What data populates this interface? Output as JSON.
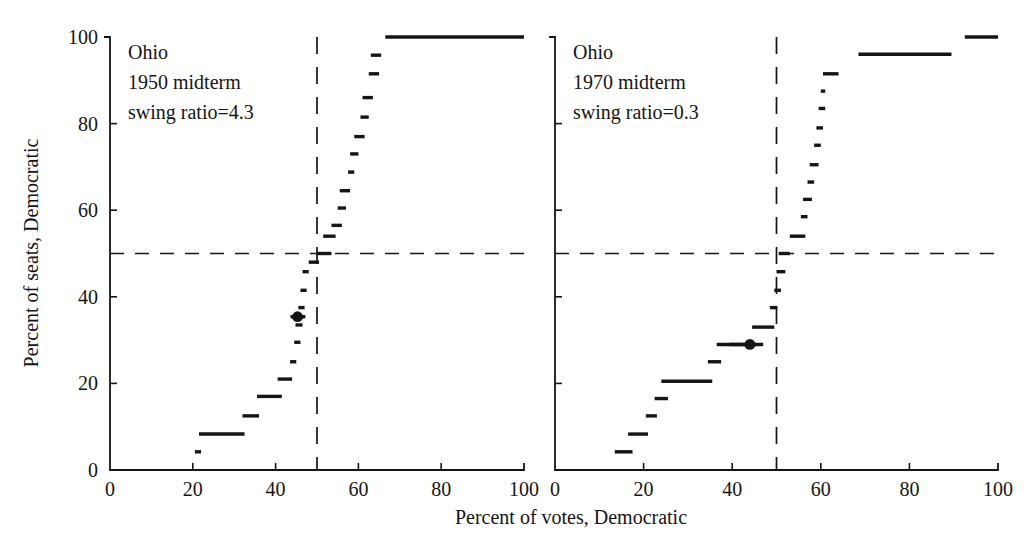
{
  "figure": {
    "title": "",
    "axis_titles": {
      "x": "Percent of votes, Democratic",
      "y": "Percent of seats, Democratic"
    },
    "colors": {
      "ink": "#151515",
      "background": "#ffffff"
    },
    "reference_lines": {
      "horizontal_value": 50,
      "vertical_value": 50,
      "style": "dashed"
    }
  },
  "chart_data": [
    {
      "type": "line",
      "panel_index": 0,
      "title": "Ohio",
      "annotations": [
        "Ohio",
        "1950 midterm",
        "swing ratio=4.3"
      ],
      "swing_ratio": 4.3,
      "state": "Ohio",
      "year": 1950,
      "election_type": "midterm",
      "xlabel": "Percent of votes, Democratic",
      "ylabel": "Percent of seats, Democratic",
      "xlim": [
        0,
        100
      ],
      "ylim": [
        0,
        100
      ],
      "xticks": [
        0,
        20,
        40,
        60,
        80,
        100
      ],
      "yticks": [
        0,
        20,
        40,
        60,
        80,
        100
      ],
      "grid": false,
      "legend": "none",
      "series": [
        {
          "name": "seats-votes curve",
          "style": "step",
          "steps": [
            {
              "x_start": 20.5,
              "x_end": 22.0,
              "y": 4.2
            },
            {
              "x_start": 21.5,
              "x_end": 32.5,
              "y": 8.3
            },
            {
              "x_start": 32.0,
              "x_end": 36.0,
              "y": 12.5
            },
            {
              "x_start": 35.5,
              "x_end": 41.5,
              "y": 17.0
            },
            {
              "x_start": 40.5,
              "x_end": 44.0,
              "y": 21.0
            },
            {
              "x_start": 43.5,
              "x_end": 45.0,
              "y": 25.0
            },
            {
              "x_start": 44.5,
              "x_end": 46.0,
              "y": 29.5
            },
            {
              "x_start": 44.8,
              "x_end": 46.5,
              "y": 33.5
            },
            {
              "x_start": 44.2,
              "x_end": 46.8,
              "y": 35.4
            },
            {
              "x_start": 45.5,
              "x_end": 47.0,
              "y": 37.5
            },
            {
              "x_start": 46.0,
              "x_end": 47.5,
              "y": 41.5
            },
            {
              "x_start": 46.5,
              "x_end": 48.0,
              "y": 45.8
            },
            {
              "x_start": 48.0,
              "x_end": 50.5,
              "y": 48.0
            },
            {
              "x_start": 50.0,
              "x_end": 53.5,
              "y": 50.0
            },
            {
              "x_start": 51.5,
              "x_end": 54.5,
              "y": 54.0
            },
            {
              "x_start": 53.5,
              "x_end": 56.0,
              "y": 56.5
            },
            {
              "x_start": 55.0,
              "x_end": 57.0,
              "y": 60.5
            },
            {
              "x_start": 55.5,
              "x_end": 58.0,
              "y": 64.5
            },
            {
              "x_start": 57.5,
              "x_end": 59.0,
              "y": 68.8
            },
            {
              "x_start": 58.0,
              "x_end": 60.0,
              "y": 73.0
            },
            {
              "x_start": 59.0,
              "x_end": 61.5,
              "y": 77.0
            },
            {
              "x_start": 60.5,
              "x_end": 62.5,
              "y": 81.5
            },
            {
              "x_start": 61.0,
              "x_end": 63.5,
              "y": 86.0
            },
            {
              "x_start": 62.5,
              "x_end": 65.0,
              "y": 91.5
            },
            {
              "x_start": 63.0,
              "x_end": 65.5,
              "y": 95.8
            },
            {
              "x_start": 66.5,
              "x_end": 100.0,
              "y": 100.0
            }
          ]
        }
      ],
      "observed_point": {
        "name": "actual election outcome",
        "x": 45.3,
        "y": 35.4,
        "marker": "filled-circle",
        "whisker_x_start": 43.6,
        "whisker_x_end": 47.2
      }
    },
    {
      "type": "line",
      "panel_index": 1,
      "title": "Ohio",
      "annotations": [
        "Ohio",
        "1970 midterm",
        "swing ratio=0.3"
      ],
      "swing_ratio": 0.3,
      "state": "Ohio",
      "year": 1970,
      "election_type": "midterm",
      "xlabel": "Percent of votes, Democratic",
      "ylabel": "Percent of seats, Democratic",
      "xlim": [
        0,
        100
      ],
      "ylim": [
        0,
        100
      ],
      "xticks": [
        0,
        20,
        40,
        60,
        80,
        100
      ],
      "yticks": [
        0,
        20,
        40,
        60,
        80,
        100
      ],
      "grid": false,
      "legend": "none",
      "series": [
        {
          "name": "seats-votes curve",
          "style": "step",
          "steps": [
            {
              "x_start": 13.5,
              "x_end": 17.5,
              "y": 4.2
            },
            {
              "x_start": 16.5,
              "x_end": 21.0,
              "y": 8.3
            },
            {
              "x_start": 20.5,
              "x_end": 23.0,
              "y": 12.5
            },
            {
              "x_start": 22.5,
              "x_end": 25.5,
              "y": 16.5
            },
            {
              "x_start": 24.0,
              "x_end": 35.5,
              "y": 20.5
            },
            {
              "x_start": 34.5,
              "x_end": 37.5,
              "y": 25.0
            },
            {
              "x_start": 36.5,
              "x_end": 45.5,
              "y": 29.0
            },
            {
              "x_start": 44.5,
              "x_end": 49.5,
              "y": 33.0
            },
            {
              "x_start": 48.5,
              "x_end": 50.2,
              "y": 37.5
            },
            {
              "x_start": 49.5,
              "x_end": 51.0,
              "y": 41.5
            },
            {
              "x_start": 50.0,
              "x_end": 52.0,
              "y": 45.8
            },
            {
              "x_start": 50.5,
              "x_end": 53.0,
              "y": 50.0
            },
            {
              "x_start": 53.0,
              "x_end": 56.5,
              "y": 54.0
            },
            {
              "x_start": 55.5,
              "x_end": 57.0,
              "y": 58.5
            },
            {
              "x_start": 56.0,
              "x_end": 58.0,
              "y": 62.5
            },
            {
              "x_start": 57.0,
              "x_end": 58.5,
              "y": 66.5
            },
            {
              "x_start": 57.5,
              "x_end": 59.5,
              "y": 70.5
            },
            {
              "x_start": 58.5,
              "x_end": 60.0,
              "y": 75.0
            },
            {
              "x_start": 59.0,
              "x_end": 60.5,
              "y": 79.0
            },
            {
              "x_start": 59.5,
              "x_end": 61.0,
              "y": 83.5
            },
            {
              "x_start": 60.0,
              "x_end": 61.0,
              "y": 87.5
            },
            {
              "x_start": 60.5,
              "x_end": 64.0,
              "y": 91.5
            },
            {
              "x_start": 68.5,
              "x_end": 89.5,
              "y": 96.0
            },
            {
              "x_start": 92.5,
              "x_end": 100.0,
              "y": 100.0
            }
          ]
        }
      ],
      "observed_point": {
        "name": "actual election outcome",
        "x": 44.0,
        "y": 29.0,
        "marker": "filled-circle",
        "whisker_x_start": 39.5,
        "whisker_x_end": 47.0
      }
    }
  ]
}
